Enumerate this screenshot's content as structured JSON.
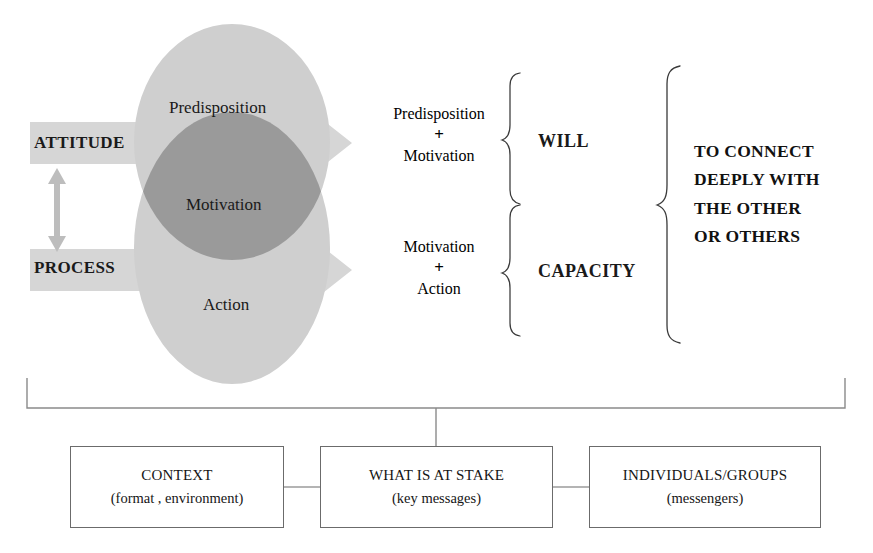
{
  "diagram": {
    "left_axis": {
      "top_label": "ATTITUDE",
      "bottom_label": "PROCESS",
      "connector_icon": "double-headed-vertical-arrow-icon"
    },
    "venn": {
      "top_circle_label": "Predisposition",
      "bottom_circle_label": "Action",
      "overlap_label": "Motivation",
      "fill_color": "#cfcfcf",
      "overlap_color": "#9a9a9a"
    },
    "arrows": {
      "top_arrow_icon": "right-arrow-icon",
      "bottom_arrow_icon": "right-arrow-icon",
      "color": "#d4d4d4"
    },
    "combinations": [
      {
        "id": "will",
        "terms": [
          "Predisposition",
          "Motivation"
        ],
        "operator": "+",
        "result": "WILL",
        "brace_icon": "curly-brace-right-icon"
      },
      {
        "id": "capacity",
        "terms": [
          "Motivation",
          "Action"
        ],
        "operator": "+",
        "result": "CAPACITY",
        "brace_icon": "curly-brace-right-icon"
      }
    ],
    "outcome": {
      "brace_icon": "curly-brace-right-icon",
      "lines": [
        "TO CONNECT",
        "DEEPLY WITH",
        "THE OTHER",
        "OR OTHERS"
      ]
    },
    "foundation": {
      "bracket_icon": "wide-bracket-icon",
      "boxes": [
        {
          "title": "CONTEXT",
          "subtitle": "(format , environment)"
        },
        {
          "title": "WHAT IS AT STAKE",
          "subtitle": "(key messages)"
        },
        {
          "title": "INDIVIDUALS/GROUPS",
          "subtitle": "(messengers)"
        }
      ]
    }
  }
}
